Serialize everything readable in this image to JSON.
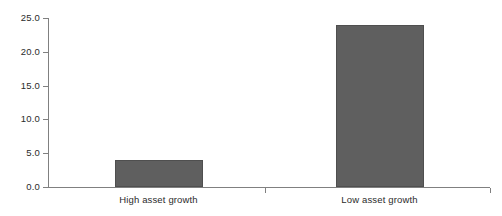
{
  "chart_data": {
    "type": "bar",
    "title": "",
    "subtitle": "",
    "xlabel": "",
    "ylabel": "",
    "categories": [
      "High asset growth",
      "Low asset growth"
    ],
    "values": [
      4.0,
      24.0
    ],
    "ylim": [
      0.0,
      25.0
    ],
    "ytick_labels": [
      "0.0",
      "5.0",
      "10.0",
      "15.0",
      "20.0",
      "25.0"
    ],
    "ytick_values": [
      0.0,
      5.0,
      10.0,
      15.0,
      20.0,
      25.0
    ],
    "grid": false,
    "legend": false,
    "legend_position": "none",
    "bar_color": "#5f5f5f",
    "bar_edge_color": "#4f4f4f",
    "axis_color": "#808080",
    "background_color": "#ffffff"
  }
}
